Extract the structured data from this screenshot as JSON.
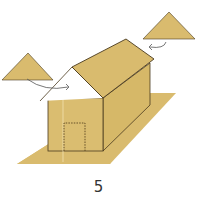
{
  "diagram": {
    "step_number": "5",
    "colors": {
      "paper": "#D9BB6E",
      "paper_light": "#E2C77E",
      "paper_dark": "#CFAF5F",
      "outline": "#4A3A1E",
      "arrow": "#555555"
    },
    "parts": [
      {
        "name": "base-sheet"
      },
      {
        "name": "house-front-wall"
      },
      {
        "name": "house-side-wall"
      },
      {
        "name": "roof"
      },
      {
        "name": "door-outline",
        "style": "dotted"
      },
      {
        "name": "gable-triangle-left",
        "note": "attaches to front gable"
      },
      {
        "name": "gable-triangle-right",
        "note": "attaches to back gable"
      }
    ]
  }
}
